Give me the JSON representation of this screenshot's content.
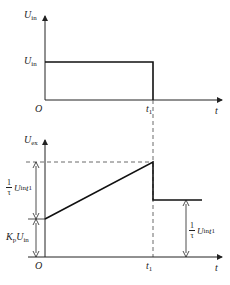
{
  "top_plot": {
    "y_axis_label": "U",
    "y_axis_sub": "in",
    "level_label": "U",
    "level_sub": "in",
    "origin": "O",
    "t1_label": "t",
    "t1_sub": "1",
    "x_axis_label": "t"
  },
  "bottom_plot": {
    "y_axis_label": "U",
    "y_axis_sub": "ex",
    "origin": "O",
    "t1_label": "t",
    "t1_sub": "1",
    "x_axis_label": "t",
    "ramp_label": {
      "num": "1",
      "den": "τ",
      "expr": "U",
      "expr_sub": "in",
      "t": "t",
      "t_sub": "1"
    },
    "offset_label": {
      "k": "K",
      "k_sub": "p",
      "u": "U",
      "u_sub": "in"
    },
    "hold_label": {
      "num": "1",
      "den": "τ",
      "expr": "U",
      "expr_sub": "in",
      "t": "t",
      "t_sub": "1"
    }
  }
}
